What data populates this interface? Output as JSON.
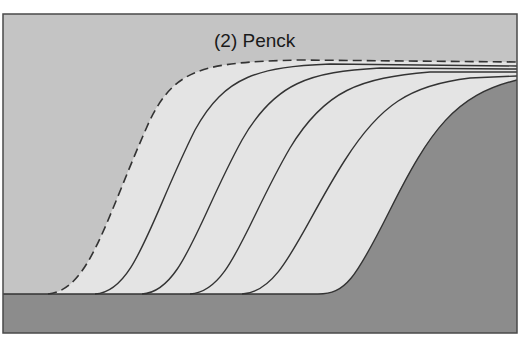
{
  "diagram": {
    "title": "(2) Penck",
    "colors": {
      "sky": "#c4c4c4",
      "weathered_regolith": "#e4e4e4",
      "bedrock": "#8c8c8c",
      "line": "#333333",
      "frame": "#4a4a4a"
    },
    "profiles": [
      {
        "label": "initial slope (dashed)",
        "style": "dashed"
      },
      {
        "label": "profile 2",
        "style": "solid"
      },
      {
        "label": "profile 3",
        "style": "solid"
      },
      {
        "label": "profile 4",
        "style": "solid"
      },
      {
        "label": "profile 5",
        "style": "solid"
      },
      {
        "label": "present bedrock slope",
        "style": "solid"
      }
    ]
  }
}
